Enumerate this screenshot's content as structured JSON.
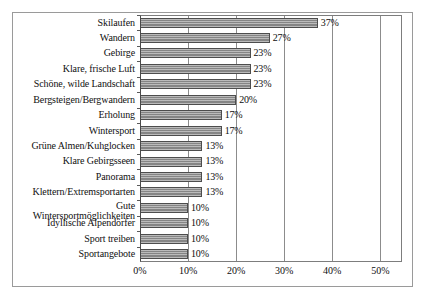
{
  "chart_data": {
    "type": "bar",
    "orientation": "horizontal",
    "title": "",
    "subtitle": "",
    "xlabel": "",
    "ylabel": "",
    "xlim": [
      0,
      54.5
    ],
    "xticks": [
      0,
      10,
      20,
      30,
      40,
      50
    ],
    "xtick_labels": [
      "0%",
      "10%",
      "20%",
      "30%",
      "40%",
      "50%"
    ],
    "grid": true,
    "legend": false,
    "value_suffix": "%",
    "bar_color": "#8d8d8d",
    "bar_border_color": "#4d4d4d",
    "categories": [
      "Skilaufen",
      "Wandern",
      "Gebirge",
      "Klare, frische Luft",
      "Schöne, wilde Landschaft",
      "Bergsteigen/Bergwandern",
      "Erholung",
      "Wintersport",
      "Grüne Almen/Kuhglocken",
      "Klare Gebirgsseen",
      "Panorama",
      "Klettern/Extremsportarten",
      "Gute Wintersportmöglichkeiten",
      "Idyllische Alpendörfer",
      "Sport treiben",
      "Sportangebote"
    ],
    "values": [
      37,
      27,
      23,
      23,
      23,
      20,
      17,
      17,
      13,
      13,
      13,
      13,
      10,
      10,
      10,
      10
    ],
    "value_labels": [
      "37%",
      "27%",
      "23%",
      "23%",
      "23%",
      "20%",
      "17%",
      "17%",
      "13%",
      "13%",
      "13%",
      "13%",
      "10%",
      "10%",
      "10%",
      "10%"
    ]
  }
}
